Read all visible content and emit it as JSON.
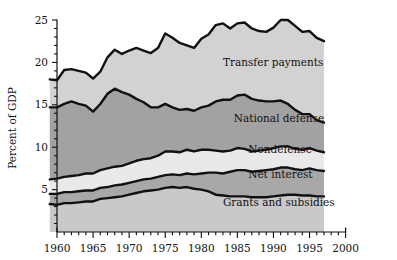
{
  "chart_data": {
    "type": "area",
    "subtype": "stacked-area",
    "title": "",
    "xlabel": "",
    "ylabel": "Percent of GDP",
    "xlim": [
      1959,
      2000
    ],
    "ylim": [
      0,
      25
    ],
    "yticks": [
      5,
      10,
      15,
      20,
      25
    ],
    "ytick_labels": [
      "5",
      "10",
      "15",
      "20",
      "25"
    ],
    "xticks": [
      1960,
      1965,
      1970,
      1975,
      1980,
      1985,
      1990,
      1995,
      2000
    ],
    "xtick_labels": [
      "1960",
      "1965",
      "1970",
      "1975",
      "1980",
      "1985",
      "1990",
      "1995",
      "2000"
    ],
    "minor_xticks": true,
    "grid": false,
    "legend": "inline-labels",
    "data_range_end": 1997,
    "x": [
      1959,
      1960,
      1961,
      1962,
      1963,
      1964,
      1965,
      1966,
      1967,
      1968,
      1969,
      1970,
      1971,
      1972,
      1973,
      1974,
      1975,
      1976,
      1977,
      1978,
      1979,
      1980,
      1981,
      1982,
      1983,
      1984,
      1985,
      1986,
      1987,
      1988,
      1989,
      1990,
      1991,
      1992,
      1993,
      1994,
      1995,
      1996,
      1997
    ],
    "series": [
      {
        "name": "Grants and subsidies",
        "color": "#c9c9c9",
        "label_x": 1986,
        "values": [
          3.3,
          3.2,
          3.4,
          3.4,
          3.5,
          3.6,
          3.6,
          3.9,
          4.0,
          4.1,
          4.2,
          4.4,
          4.6,
          4.8,
          4.9,
          5.0,
          5.2,
          5.3,
          5.2,
          5.3,
          5.1,
          5.0,
          4.8,
          4.4,
          4.3,
          4.2,
          4.2,
          4.2,
          4.1,
          4.1,
          4.1,
          4.2,
          4.3,
          4.4,
          4.4,
          4.3,
          4.3,
          4.2,
          4.2
        ]
      },
      {
        "name": "Net interest",
        "color": "#a8a8a8",
        "label_x": 1988,
        "values": [
          1.2,
          1.3,
          1.3,
          1.3,
          1.3,
          1.3,
          1.3,
          1.3,
          1.3,
          1.4,
          1.4,
          1.4,
          1.4,
          1.4,
          1.4,
          1.5,
          1.5,
          1.5,
          1.5,
          1.6,
          1.7,
          1.9,
          2.2,
          2.6,
          2.6,
          2.9,
          3.1,
          3.1,
          3.0,
          3.1,
          3.2,
          3.2,
          3.3,
          3.2,
          3.0,
          3.0,
          3.2,
          3.1,
          3.0
        ]
      },
      {
        "name": "Nondefense",
        "color": "#e9e9e9",
        "label_x": 1988,
        "values": [
          1.7,
          1.8,
          1.8,
          1.9,
          1.9,
          2.0,
          2.0,
          2.1,
          2.2,
          2.2,
          2.2,
          2.3,
          2.4,
          2.4,
          2.4,
          2.5,
          2.8,
          2.7,
          2.7,
          2.8,
          2.7,
          2.8,
          2.7,
          2.6,
          2.6,
          2.5,
          2.6,
          2.5,
          2.4,
          2.4,
          2.4,
          2.5,
          2.5,
          2.5,
          2.4,
          2.4,
          2.4,
          2.3,
          2.2
        ]
      },
      {
        "name": "National defense",
        "color": "#a2a2a2",
        "label_x": 1987,
        "values": [
          8.5,
          8.4,
          8.6,
          8.8,
          8.4,
          8.0,
          7.3,
          7.8,
          8.8,
          9.2,
          8.7,
          8.1,
          7.3,
          6.7,
          6.0,
          5.7,
          5.6,
          5.2,
          5.0,
          4.8,
          4.8,
          5.0,
          5.2,
          5.8,
          6.1,
          6.0,
          6.2,
          6.4,
          6.2,
          5.9,
          5.7,
          5.5,
          5.4,
          5.0,
          4.6,
          4.2,
          4.0,
          3.6,
          3.5
        ]
      },
      {
        "name": "Transfer payments",
        "color": "#d2d2d2",
        "label_x": 1984,
        "values": [
          3.3,
          3.2,
          4.0,
          3.8,
          3.9,
          3.9,
          3.9,
          3.8,
          4.3,
          4.6,
          4.5,
          5.2,
          6.0,
          6.1,
          6.4,
          7.0,
          8.3,
          8.2,
          7.9,
          7.5,
          7.4,
          8.1,
          8.4,
          9.0,
          9.0,
          8.4,
          8.5,
          8.5,
          8.3,
          8.2,
          8.2,
          8.7,
          9.5,
          9.9,
          9.9,
          9.7,
          9.8,
          9.7,
          9.6
        ]
      }
    ]
  }
}
